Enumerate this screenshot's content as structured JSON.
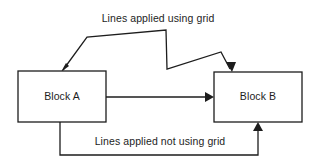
{
  "diagram": {
    "background_color": "#ffffff",
    "stroke_color": "#1d1d1d",
    "text_color": "#1d1d1d",
    "captions": {
      "top": "Lines applied using grid",
      "bottom": "Lines applied not using grid"
    },
    "blocks": [
      {
        "id": "block-a",
        "label": "Block A",
        "x": 18,
        "y": 71,
        "width": 88,
        "height": 51
      },
      {
        "id": "block-b",
        "label": "Block B",
        "x": 214,
        "y": 72,
        "width": 88,
        "height": 50
      }
    ],
    "connectors": [
      {
        "id": "grid-connector",
        "description": "Orthogonal/grid routed polyline from Block A top to Block B top",
        "points": "62,71 87,37 166,30 167,70 222,52 231,71",
        "arrow_at": "Block B top edge",
        "second_arrow_at": "Block A top edge"
      },
      {
        "id": "direct-connector",
        "description": "Straight horizontal arrow from Block A right edge to Block B left edge",
        "points": "106,97 213,97",
        "arrow_at": "Block B left edge"
      },
      {
        "id": "free-connector",
        "description": "Non-grid routed polyline from Block A bottom around to Block B bottom",
        "points": "60,122 60,155 258,155 258,124",
        "arrow_at": "Block B bottom edge"
      }
    ]
  }
}
